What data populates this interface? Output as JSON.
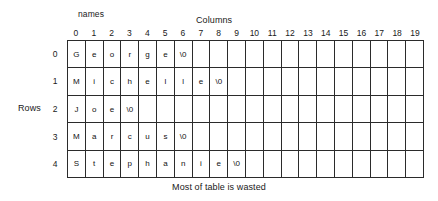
{
  "figure": {
    "names_label": "names",
    "columns_label": "Columns",
    "rows_label": "Rows",
    "caption": "Most of table is wasted"
  },
  "grid": {
    "column_headers": [
      "0",
      "1",
      "2",
      "3",
      "4",
      "5",
      "6",
      "7",
      "8",
      "9",
      "10",
      "11",
      "12",
      "13",
      "14",
      "15",
      "16",
      "17",
      "18",
      "19"
    ],
    "row_headers": [
      "0",
      "1",
      "2",
      "3",
      "4"
    ],
    "rows": [
      [
        "G",
        "e",
        "o",
        "r",
        "g",
        "e",
        "\\0",
        "",
        "",
        "",
        "",
        "",
        "",
        "",
        "",
        "",
        "",
        "",
        "",
        ""
      ],
      [
        "M",
        "i",
        "c",
        "h",
        "e",
        "l",
        "l",
        "e",
        "\\0",
        "",
        "",
        "",
        "",
        "",
        "",
        "",
        "",
        "",
        "",
        ""
      ],
      [
        "J",
        "o",
        "e",
        "\\0",
        "",
        "",
        "",
        "",
        "",
        "",
        "",
        "",
        "",
        "",
        "",
        "",
        "",
        "",
        "",
        ""
      ],
      [
        "M",
        "a",
        "r",
        "c",
        "u",
        "s",
        "\\0",
        "",
        "",
        "",
        "",
        "",
        "",
        "",
        "",
        "",
        "",
        "",
        "",
        ""
      ],
      [
        "S",
        "t",
        "e",
        "p",
        "h",
        "a",
        "n",
        "i",
        "e",
        "\\0",
        "",
        "",
        "",
        "",
        "",
        "",
        "",
        "",
        "",
        ""
      ]
    ]
  }
}
